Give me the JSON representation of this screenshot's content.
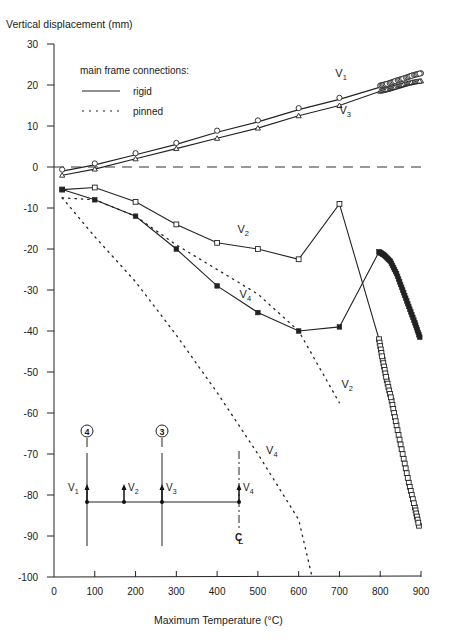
{
  "chart_data": {
    "type": "line",
    "title": "",
    "xlabel": "Maximum Temperature (°C)",
    "ylabel": "Vertical displacement (mm)",
    "xlim": [
      0,
      900
    ],
    "ylim": [
      -100,
      30
    ],
    "x_ticks": [
      0,
      100,
      200,
      300,
      400,
      500,
      600,
      700,
      800,
      900
    ],
    "y_ticks": [
      30,
      20,
      10,
      0,
      -10,
      -20,
      -30,
      -40,
      -50,
      -60,
      -70,
      -80,
      -90,
      -100
    ],
    "grid": false,
    "zero_line": "dashed",
    "legend": {
      "title": "main frame connections:",
      "entries": [
        {
          "label": "rigid",
          "style": "solid"
        },
        {
          "label": "pinned",
          "style": "dotted"
        }
      ],
      "position": "upper-left"
    },
    "series": [
      {
        "name": "V1",
        "connection": "rigid",
        "marker": "circle",
        "x": [
          20,
          100,
          200,
          300,
          400,
          500,
          600,
          700,
          800,
          820,
          840,
          860,
          880,
          900
        ],
        "y": [
          -1,
          0.5,
          3,
          5.5,
          8.5,
          11,
          14,
          16.5,
          19.5,
          20,
          20.7,
          21.3,
          22,
          22.5
        ]
      },
      {
        "name": "V3",
        "connection": "rigid",
        "marker": "triangle",
        "x": [
          20,
          100,
          200,
          300,
          400,
          500,
          600,
          700,
          800,
          820,
          840,
          860,
          880,
          900
        ],
        "y": [
          -2,
          -0.5,
          2,
          4.5,
          7,
          9.5,
          12.5,
          15,
          18.5,
          19,
          19.6,
          20.2,
          20.7,
          21
        ]
      },
      {
        "name": "V2",
        "connection": "rigid",
        "marker": "square",
        "x": [
          20,
          100,
          200,
          300,
          400,
          500,
          600,
          700,
          797,
          806,
          816,
          828,
          840,
          855,
          870,
          885,
          895
        ],
        "y": [
          -5.5,
          -5,
          -8.5,
          -14,
          -18.5,
          -20,
          -22.5,
          -9,
          -42,
          -47,
          -52,
          -57,
          -63,
          -70,
          -77,
          -83,
          -87.5
        ]
      },
      {
        "name": "V4",
        "connection": "rigid",
        "marker": "star",
        "x": [
          20,
          100,
          200,
          300,
          400,
          500,
          600,
          700,
          797,
          810,
          825,
          840,
          855,
          870,
          885,
          897
        ],
        "y": [
          -5.5,
          -8,
          -12,
          -20,
          -29,
          -35.5,
          -40,
          -39,
          -20.7,
          -21.5,
          -23,
          -26,
          -30,
          -34,
          -38,
          -41.5
        ]
      },
      {
        "name": "V2",
        "connection": "pinned",
        "marker": "none",
        "x": [
          20,
          100,
          200,
          300,
          400,
          500,
          600,
          700
        ],
        "y": [
          -7.5,
          -8,
          -12,
          -19,
          -25,
          -31,
          -40,
          -57.5
        ]
      },
      {
        "name": "V4",
        "connection": "pinned",
        "marker": "none",
        "x": [
          20,
          100,
          200,
          300,
          400,
          500,
          600,
          633
        ],
        "y": [
          -7.5,
          -17,
          -28,
          -41,
          -55,
          -70,
          -86,
          -100
        ]
      }
    ],
    "annotations": [
      {
        "text": "V1",
        "x": 690,
        "y": 22
      },
      {
        "text": "V3",
        "x": 700,
        "y": 13
      },
      {
        "text": "V2",
        "x": 450,
        "y": -16
      },
      {
        "text": "V4",
        "x": 455,
        "y": -32
      },
      {
        "text": "V2",
        "x": 705,
        "y": -54
      },
      {
        "text": "V4",
        "x": 520,
        "y": -70
      }
    ],
    "inset": {
      "description": "frame elevation showing measurement points",
      "column_labels": [
        "4",
        "3"
      ],
      "point_labels": [
        "V1",
        "V2",
        "V3",
        "V4"
      ],
      "centerline_label": "CL"
    }
  },
  "labels": {
    "ylabel": "Vertical displacement (mm)",
    "xlabel": "Maximum Temperature (°C)"
  }
}
